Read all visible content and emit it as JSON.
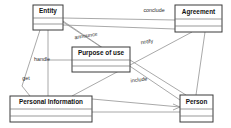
{
  "diagram": {
    "type": "uml-class-diagram",
    "background_color": "#ffffff",
    "line_color": "#8c8c8c",
    "box_border_color": "#3a3a3a",
    "classes": [
      {
        "id": "entity",
        "name": "Entity",
        "x": 33,
        "y": 5,
        "w": 30,
        "h": 25
      },
      {
        "id": "agreement",
        "name": "Agreement",
        "x": 175,
        "y": 5,
        "w": 47,
        "h": 27
      },
      {
        "id": "purpose",
        "name": "Purpose of use",
        "x": 72,
        "y": 47,
        "w": 58,
        "h": 25
      },
      {
        "id": "personal",
        "name": "Personal Information",
        "x": 10,
        "y": 96,
        "w": 82,
        "h": 26
      },
      {
        "id": "person",
        "name": "Person",
        "x": 180,
        "y": 95,
        "w": 33,
        "h": 27
      }
    ],
    "associations": [
      {
        "id": "conclude",
        "label": "conclude",
        "from": "entity",
        "to": "agreement",
        "label_x": 154,
        "label_y": 11
      },
      {
        "id": "announce",
        "label": "announce",
        "from": "entity",
        "to": "purpose",
        "label_x": 86,
        "label_y": 36
      },
      {
        "id": "notify",
        "label": "notify",
        "from": "entity",
        "to": "person",
        "label_x": 147,
        "label_y": 42
      },
      {
        "id": "handle",
        "label": "handle",
        "from": "entity",
        "to": "personal",
        "label_x": 42,
        "label_y": 60
      },
      {
        "id": "get",
        "label": "get",
        "from": "entity",
        "to": "personal",
        "label_x": 26,
        "label_y": 79
      },
      {
        "id": "include",
        "label": "include",
        "from": "personal",
        "to": "person",
        "label_x": 139,
        "label_y": 80
      }
    ]
  }
}
